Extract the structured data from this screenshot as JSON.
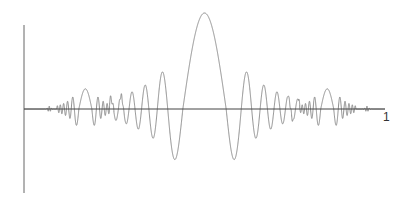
{
  "chart_data": {
    "type": "line",
    "title": "",
    "xlabel": "",
    "ylabel": "",
    "x_tick_labels": [
      "1"
    ],
    "x_range": [
      0,
      1
    ],
    "grid": false,
    "legend": null,
    "features": [
      {
        "name": "central-lobe",
        "x": 0.5,
        "peak_y": 1.0,
        "trough_y": -0.63
      },
      {
        "name": "left-burst",
        "x": 0.17,
        "peak_y": 0.21,
        "trough_y": -0.21
      },
      {
        "name": "right-burst",
        "x": 0.84,
        "peak_y": 0.21,
        "trough_y": -0.21
      },
      {
        "name": "blip",
        "x": 0.07,
        "amplitude": 0.03
      },
      {
        "name": "blip",
        "x": 0.27,
        "amplitude": 0.03
      },
      {
        "name": "blip",
        "x": 0.74,
        "amplitude": 0.03
      },
      {
        "name": "blip",
        "x": 0.95,
        "amplitude": 0.03
      }
    ]
  },
  "axes": {
    "x_end_label": "1",
    "line_color": "#555555",
    "curve_color": "#777777"
  }
}
